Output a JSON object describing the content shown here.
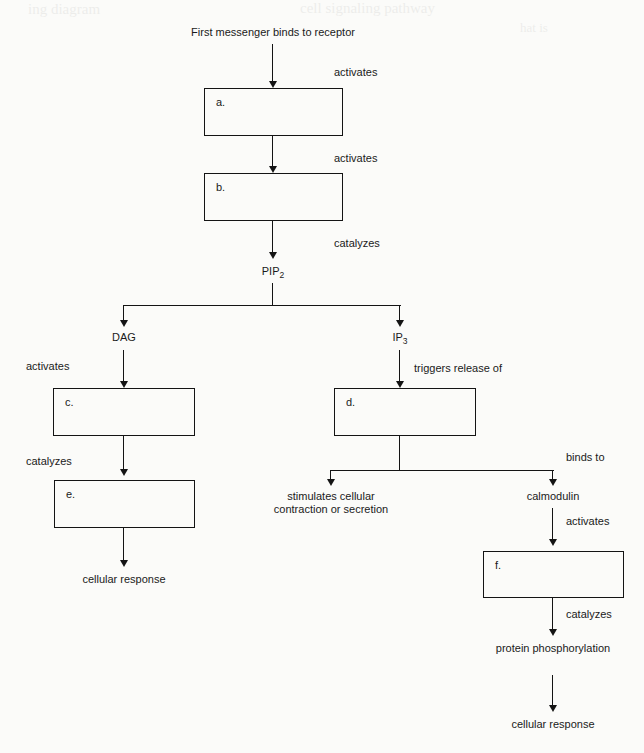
{
  "diagram": {
    "title": "First messenger binds to receptor",
    "labels": {
      "activates": "activates",
      "catalyzes": "catalyzes",
      "triggers_release_of": "triggers release of",
      "binds_to": "binds to"
    },
    "nodes": {
      "start": "First messenger binds to receptor",
      "box_a": "a.",
      "box_b": "b.",
      "pip2_text": "PIP",
      "pip2_sub": "2",
      "dag": "DAG",
      "ip3_text": "IP",
      "ip3_sub": "3",
      "box_c": "c.",
      "box_d": "d.",
      "box_e": "e.",
      "box_f": "f.",
      "cellular_response_left": "cellular response",
      "stimulates_block": "stimulates cellular contraction or secretion",
      "calmodulin": "calmodulin",
      "protein_phosphorylation": "protein phosphorylation",
      "cellular_response_right": "cellular response"
    },
    "edge_labels": {
      "start_to_a": "activates",
      "a_to_b": "activates",
      "b_to_pip2": "catalyzes",
      "dag_to_c": "activates",
      "c_to_e": "catalyzes",
      "ip3_to_d": "triggers release of",
      "d_to_calmodulin": "binds to",
      "calmodulin_to_f": "activates",
      "f_to_phos": "catalyzes"
    },
    "colors": {
      "line": "#141414",
      "text": "#1a1a1a",
      "page": "#fbfbf9"
    },
    "bleed_text": {
      "line1": "ing  diagram",
      "line2": "cell signaling pathway",
      "line3": "hat is"
    }
  }
}
